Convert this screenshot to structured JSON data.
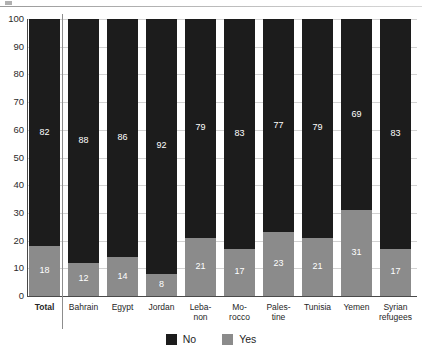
{
  "chart_data": {
    "type": "bar",
    "subtype": "stacked-100",
    "title": "",
    "xlabel": "",
    "ylabel": "",
    "ylim": [
      0,
      100
    ],
    "ytick_step": 10,
    "yticks": [
      100,
      90,
      80,
      70,
      60,
      50,
      40,
      30,
      20,
      10,
      0
    ],
    "grid": true,
    "legend_position": "bottom-center",
    "categories": [
      "Total",
      "Bahrain",
      "Egypt",
      "Jordan",
      "Leba-\nnon",
      "Mo-\nrocco",
      "Pales-\ntine",
      "Tunisia",
      "Yemen",
      "Syrian\nrefugees"
    ],
    "series": [
      {
        "name": "No",
        "color": "#1c1c1c",
        "values": [
          82,
          88,
          86,
          92,
          79,
          83,
          77,
          79,
          69,
          83
        ]
      },
      {
        "name": "Yes",
        "color": "#8b8b8b",
        "values": [
          18,
          12,
          14,
          8,
          21,
          17,
          23,
          21,
          31,
          17
        ]
      }
    ]
  },
  "axis": {
    "yticks": [
      "100",
      "90",
      "80",
      "70",
      "60",
      "50",
      "40",
      "30",
      "20",
      "10",
      "0"
    ]
  },
  "categories": [
    {
      "line1": "Total",
      "line2": "",
      "bold": true
    },
    {
      "line1": "Bahrain",
      "line2": "",
      "bold": false
    },
    {
      "line1": "Egypt",
      "line2": "",
      "bold": false
    },
    {
      "line1": "Jordan",
      "line2": "",
      "bold": false
    },
    {
      "line1": "Leba-",
      "line2": "non",
      "bold": false
    },
    {
      "line1": "Mo-",
      "line2": "rocco",
      "bold": false
    },
    {
      "line1": "Pales-",
      "line2": "tine",
      "bold": false
    },
    {
      "line1": "Tunisia",
      "line2": "",
      "bold": false
    },
    {
      "line1": "Yemen",
      "line2": "",
      "bold": false
    },
    {
      "line1": "Syrian",
      "line2": "refugees",
      "bold": false
    }
  ],
  "bars": [
    {
      "name": "total",
      "no": "82",
      "yes": "18"
    },
    {
      "name": "bahrain",
      "no": "88",
      "yes": "12"
    },
    {
      "name": "egypt",
      "no": "86",
      "yes": "14"
    },
    {
      "name": "jordan",
      "no": "92",
      "yes": "8"
    },
    {
      "name": "lebanon",
      "no": "79",
      "yes": "21"
    },
    {
      "name": "morocco",
      "no": "83",
      "yes": "17"
    },
    {
      "name": "palestine",
      "no": "77",
      "yes": "23"
    },
    {
      "name": "tunisia",
      "no": "79",
      "yes": "21"
    },
    {
      "name": "yemen",
      "no": "69",
      "yes": "31"
    },
    {
      "name": "syrian-refugees",
      "no": "83",
      "yes": "17"
    }
  ],
  "legend": {
    "items": [
      {
        "label": "No",
        "color": "#1c1c1c"
      },
      {
        "label": "Yes",
        "color": "#8b8b8b"
      }
    ]
  }
}
